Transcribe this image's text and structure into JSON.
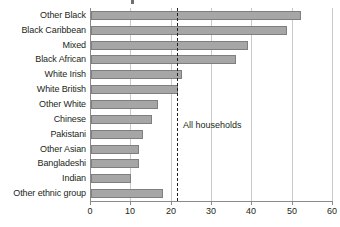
{
  "chart_data": {
    "type": "bar",
    "orientation": "horizontal",
    "title": "",
    "xlabel": "",
    "ylabel": "",
    "xlim": [
      0,
      60
    ],
    "xticks": [
      0,
      10,
      20,
      30,
      40,
      50,
      60
    ],
    "grid": true,
    "legend": false,
    "categories": [
      "Other Black",
      "Black Caribbean",
      "Mixed",
      "Black African",
      "White Irish",
      "White British",
      "Other White",
      "Chinese",
      "Pakistani",
      "Other Asian",
      "Bangladeshi",
      "Indian",
      "Other ethnic group"
    ],
    "values": [
      52,
      48.5,
      39,
      36,
      22.5,
      21.5,
      16.5,
      15,
      13,
      12,
      12,
      10,
      17.8
    ],
    "annotations": [
      {
        "name": "all-households-reference",
        "label": "All households",
        "value": 21.5,
        "style": "dashed-vertical-line"
      }
    ],
    "colors": {
      "bar_fill": "#a6a6a6",
      "bar_stroke": "#7f7f7f",
      "gridline": "#c9c9c9",
      "axis": "#8a8a8a",
      "text": "#231f20"
    }
  }
}
